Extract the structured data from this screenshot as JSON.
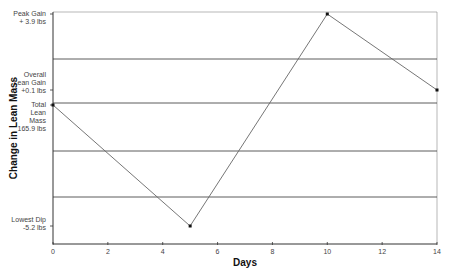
{
  "chart_data": {
    "type": "line",
    "title": "",
    "xlabel": "Days",
    "ylabel": "Change in Lean Mass",
    "xlim": [
      0,
      14
    ],
    "x_ticks": [
      "0",
      "2",
      "4",
      "6",
      "8",
      "10",
      "12",
      "14"
    ],
    "grid": true,
    "legend": null,
    "series": [
      {
        "name": "Change in Lean Mass",
        "x": [
          0,
          5,
          10,
          14
        ],
        "values": [
          0,
          -5.2,
          3.9,
          0.1
        ],
        "units": "lbs"
      }
    ],
    "y_annotations": [
      {
        "lines": [
          "Peak Gain",
          "+ 3.9 lbs"
        ],
        "value": 3.9
      },
      {
        "lines": [
          "Overall",
          "Lean Gain",
          "+0.1 lbs"
        ],
        "value": 0.1
      },
      {
        "lines": [
          "Total",
          "Lean",
          "Mass",
          "165.9 lbs"
        ],
        "value": 0
      },
      {
        "lines": [
          "Lowest Dip",
          "-5.2 lbs"
        ],
        "value": -5.2
      }
    ],
    "colors": {
      "line": "#555555",
      "grid": "#333333",
      "marker": "#111111"
    }
  }
}
